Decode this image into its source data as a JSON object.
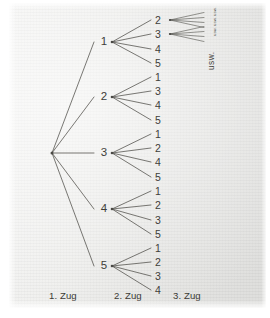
{
  "diagram": {
    "kind": "probability-tree",
    "root": {
      "x": 52,
      "y": 153
    },
    "level1": [
      {
        "label": "1",
        "x": 104,
        "y": 42
      },
      {
        "label": "2",
        "x": 104,
        "y": 97
      },
      {
        "label": "3",
        "x": 104,
        "y": 153
      },
      {
        "label": "4",
        "x": 104,
        "y": 209
      },
      {
        "label": "5",
        "x": 104,
        "y": 266
      }
    ],
    "level2": [
      {
        "parent": "1",
        "label": "2",
        "x": 158,
        "y": 20
      },
      {
        "parent": "1",
        "label": "3",
        "x": 158,
        "y": 34
      },
      {
        "parent": "1",
        "label": "4",
        "x": 158,
        "y": 49
      },
      {
        "parent": "1",
        "label": "5",
        "x": 158,
        "y": 63
      },
      {
        "parent": "2",
        "label": "1",
        "x": 158,
        "y": 77
      },
      {
        "parent": "2",
        "label": "3",
        "x": 158,
        "y": 91
      },
      {
        "parent": "2",
        "label": "4",
        "x": 158,
        "y": 105
      },
      {
        "parent": "2",
        "label": "5",
        "x": 158,
        "y": 120
      },
      {
        "parent": "3",
        "label": "1",
        "x": 158,
        "y": 134
      },
      {
        "parent": "3",
        "label": "2",
        "x": 158,
        "y": 148
      },
      {
        "parent": "3",
        "label": "4",
        "x": 158,
        "y": 162
      },
      {
        "parent": "3",
        "label": "5",
        "x": 158,
        "y": 177
      },
      {
        "parent": "4",
        "label": "1",
        "x": 158,
        "y": 191
      },
      {
        "parent": "4",
        "label": "2",
        "x": 158,
        "y": 205
      },
      {
        "parent": "4",
        "label": "3",
        "x": 158,
        "y": 220
      },
      {
        "parent": "4",
        "label": "5",
        "x": 158,
        "y": 234
      },
      {
        "parent": "5",
        "label": "1",
        "x": 158,
        "y": 248
      },
      {
        "parent": "5",
        "label": "2",
        "x": 158,
        "y": 262
      },
      {
        "parent": "5",
        "label": "3",
        "x": 158,
        "y": 276
      },
      {
        "parent": "5",
        "label": "4",
        "x": 158,
        "y": 290
      }
    ],
    "level3_fans": [
      {
        "from": "2",
        "x": 170,
        "y": 20,
        "branches": 4
      },
      {
        "from": "3",
        "x": 170,
        "y": 34,
        "branches": 4
      }
    ],
    "continuation": {
      "label": "usw.",
      "x": 207,
      "y": 70
    },
    "continuation_small": {
      "label": "usw. usw. usw.",
      "x": 213,
      "y": 36
    },
    "columns": [
      {
        "label": "1. Zug",
        "x": 49,
        "y": 296
      },
      {
        "label": "2. Zug",
        "x": 114,
        "y": 296
      },
      {
        "label": "3. Zug",
        "x": 173,
        "y": 296
      }
    ]
  },
  "colors": {
    "ink": "#3e3d39",
    "line": "#55544f",
    "paper_light": "#f4f4f3",
    "paper_dark": "#dededc",
    "margin": "#ffffff"
  }
}
